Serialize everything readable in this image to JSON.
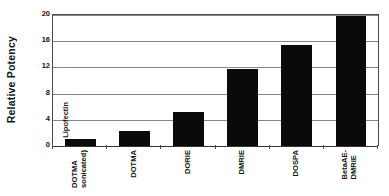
{
  "chart_data": {
    "type": "bar",
    "title": "",
    "subtitle": "",
    "xlabel": "",
    "ylabel": "Relative Potency",
    "categories": [
      "DOTMA (sonicated)",
      "DOTMA",
      "DORIE",
      "DMRIE",
      "DOSPA",
      "BetaAE-DMRIE"
    ],
    "category_lines": [
      [
        "DOTMA",
        "sonicated)"
      ],
      [
        "DOTMA",
        ""
      ],
      [
        "DORIE",
        ""
      ],
      [
        "DMRIE",
        ""
      ],
      [
        "DOSPA",
        ""
      ],
      [
        "BetaAE-",
        "DMRIE"
      ]
    ],
    "values": [
      1.1,
      2.3,
      5.2,
      11.8,
      15.4,
      19.9
    ],
    "ylim": [
      0,
      20
    ],
    "yticks": [
      0,
      4,
      8,
      12,
      16,
      20
    ],
    "ytick_labels": [
      "0",
      "4",
      "8",
      "12",
      "16",
      "20"
    ],
    "grid": "horizontal",
    "legend": "none",
    "bar_color": "#0a0a0a",
    "gridline_color": "#868686",
    "axis_color": "#4a4a4a",
    "annotations": [
      {
        "text": "Lipofectin",
        "target_category": "DOTMA (sonicated)",
        "orientation": "vertical"
      }
    ]
  },
  "figure": {
    "background": "#ffffff",
    "ylabel": "Relative Potency",
    "annotation_label": "Lipofectin"
  }
}
